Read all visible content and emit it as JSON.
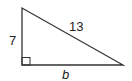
{
  "diagram": {
    "type": "right-triangle",
    "labels": {
      "vertical_leg": "7",
      "hypotenuse": "13",
      "horizontal_leg": "b"
    },
    "vertices": {
      "top": [
        22,
        8
      ],
      "right_angle": [
        22,
        65
      ],
      "right": [
        123,
        65
      ]
    },
    "stroke_color": "#333333"
  }
}
